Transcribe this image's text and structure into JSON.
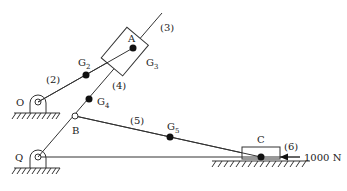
{
  "diagram": {
    "title": "",
    "labels": {
      "link2": "(2)",
      "link3": "(3)",
      "link4": "(4)",
      "link5": "(5)",
      "link6": "(6)",
      "A": "A",
      "B": "B",
      "C": "C",
      "O": "O",
      "Q": "Q",
      "G2": "G",
      "G2_sub": "2",
      "G3": "G",
      "G3_sub": "3",
      "G4": "G",
      "G4_sub": "4",
      "G5": "G",
      "G5_sub": "5",
      "force": "1000 N"
    },
    "colors": {
      "line": "#333333",
      "point": "#111111"
    }
  }
}
